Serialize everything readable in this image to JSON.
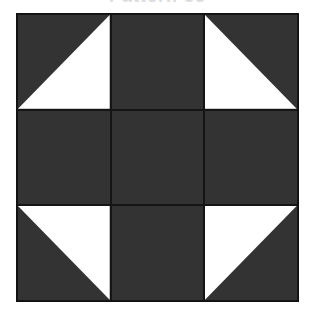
{
  "title": "Pattern 33",
  "colors": {
    "dark": "#333333",
    "light": "#ffffff",
    "line": "#111111"
  },
  "block": {
    "rows": 3,
    "cols": 3,
    "cells": [
      {
        "row": 0,
        "col": 0,
        "type": "half-square-triangle",
        "light_corner": "bottom-right"
      },
      {
        "row": 0,
        "col": 1,
        "type": "solid",
        "fill": "dark"
      },
      {
        "row": 0,
        "col": 2,
        "type": "half-square-triangle",
        "light_corner": "bottom-left"
      },
      {
        "row": 1,
        "col": 0,
        "type": "solid",
        "fill": "dark"
      },
      {
        "row": 1,
        "col": 1,
        "type": "solid",
        "fill": "dark"
      },
      {
        "row": 1,
        "col": 2,
        "type": "solid",
        "fill": "dark"
      },
      {
        "row": 2,
        "col": 0,
        "type": "half-square-triangle",
        "light_corner": "top-right"
      },
      {
        "row": 2,
        "col": 1,
        "type": "solid",
        "fill": "dark"
      },
      {
        "row": 2,
        "col": 2,
        "type": "half-square-triangle",
        "light_corner": "top-left"
      }
    ]
  }
}
